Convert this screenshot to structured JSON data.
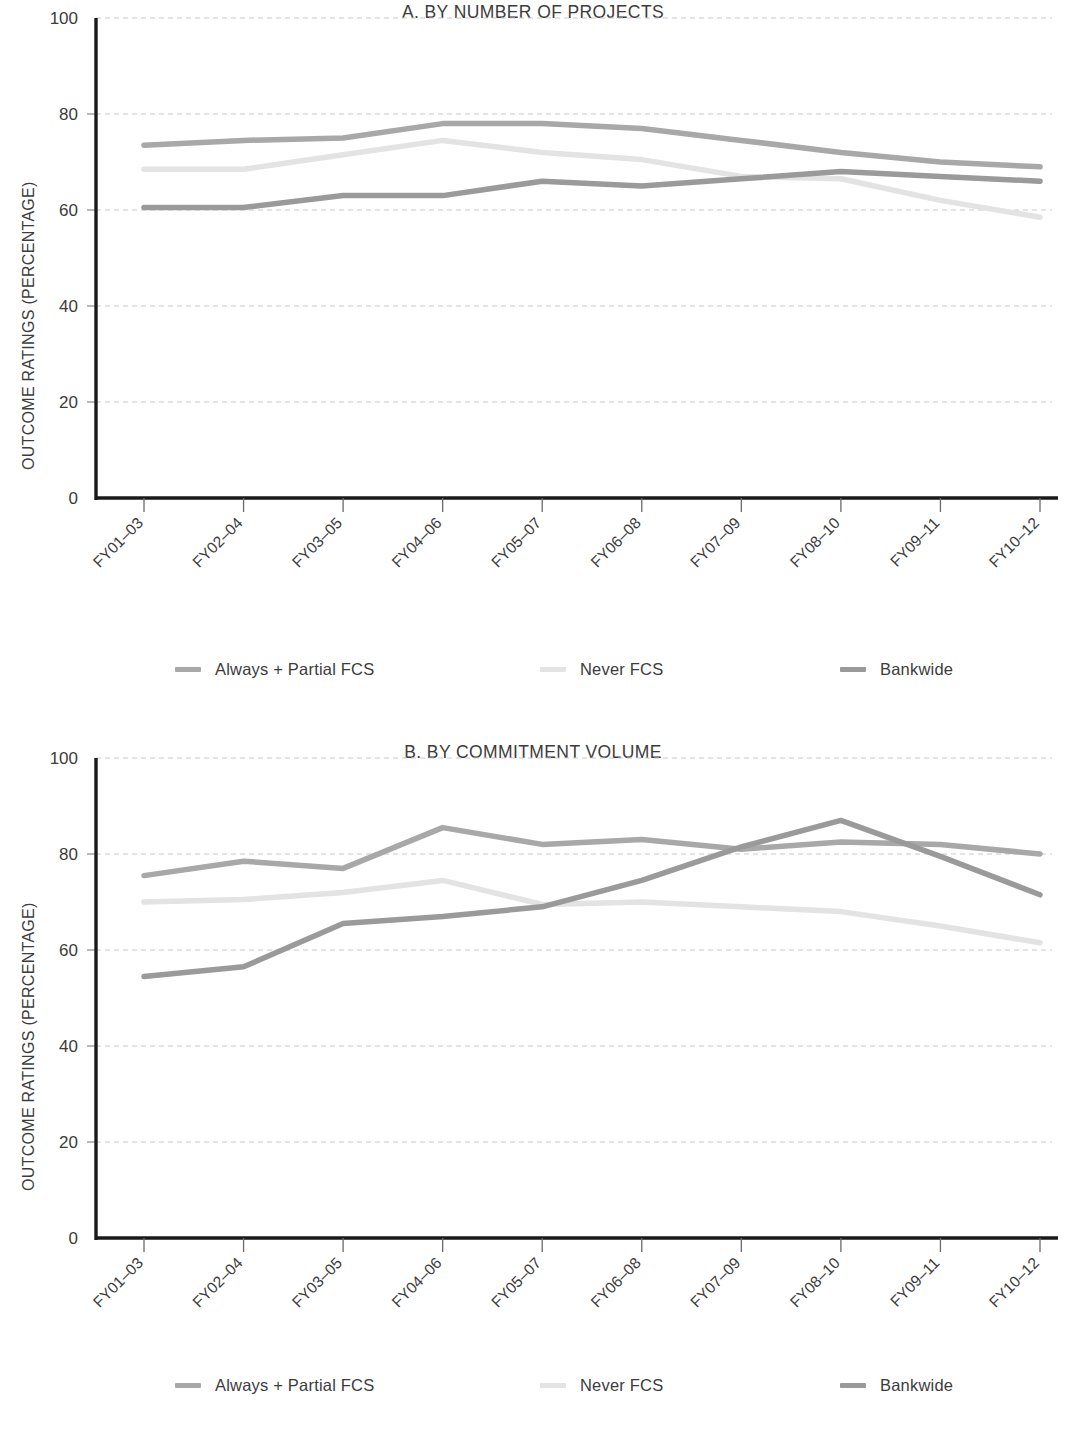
{
  "figure": {
    "ylabel": "OUTCOME RATINGS (PERCENTAGE)",
    "series_colors": {
      "always_partial_fcs": "#a8a8a8",
      "never_fcs": "#e3e3e3",
      "bankwide": "#9a9a9a"
    },
    "axis_color": "#1a1a1a",
    "grid_color": "#c9c9c9"
  },
  "panel_a": {
    "title": "A. BY NUMBER OF PROJECTS",
    "ylabel": "OUTCOME RATINGS (PERCENTAGE)",
    "legend": [
      {
        "label": "Always + Partial FCS",
        "color": "#a8a8a8"
      },
      {
        "label": "Never FCS",
        "color": "#e3e3e3"
      },
      {
        "label": "Bankwide",
        "color": "#9a9a9a"
      }
    ]
  },
  "panel_b": {
    "title": "B. BY COMMITMENT VOLUME",
    "ylabel": "OUTCOME RATINGS (PERCENTAGE)",
    "legend": [
      {
        "label": "Always + Partial FCS",
        "color": "#a8a8a8"
      },
      {
        "label": "Never FCS",
        "color": "#e3e3e3"
      },
      {
        "label": "Bankwide",
        "color": "#9a9a9a"
      }
    ]
  },
  "chart_data": [
    {
      "type": "line",
      "title": "A. BY NUMBER OF PROJECTS",
      "xlabel": "",
      "ylabel": "OUTCOME RATINGS (PERCENTAGE)",
      "ylim": [
        0,
        100
      ],
      "yticks": [
        0,
        20,
        40,
        60,
        80,
        100
      ],
      "grid": "horizontal-dashed",
      "legend_position": "below",
      "categories": [
        "FY01–03",
        "FY02–04",
        "FY03–05",
        "FY04–06",
        "FY05–07",
        "FY06–08",
        "FY07–09",
        "FY08–10",
        "FY09–11",
        "FY10–12"
      ],
      "series": [
        {
          "name": "Always + Partial FCS",
          "color": "#a8a8a8",
          "values": [
            73.5,
            74.5,
            75.0,
            78.0,
            78.0,
            77.0,
            74.5,
            72.0,
            70.0,
            69.0
          ]
        },
        {
          "name": "Never FCS",
          "color": "#e3e3e3",
          "values": [
            68.5,
            68.5,
            71.5,
            74.5,
            72.0,
            70.5,
            67.0,
            66.5,
            62.0,
            58.5
          ]
        },
        {
          "name": "Bankwide",
          "color": "#9a9a9a",
          "values": [
            60.5,
            60.5,
            63.0,
            63.0,
            66.0,
            65.0,
            66.5,
            68.0,
            67.0,
            66.0
          ]
        }
      ]
    },
    {
      "type": "line",
      "title": "B. BY COMMITMENT VOLUME",
      "xlabel": "",
      "ylabel": "OUTCOME RATINGS (PERCENTAGE)",
      "ylim": [
        0,
        100
      ],
      "yticks": [
        0,
        20,
        40,
        60,
        80,
        100
      ],
      "grid": "horizontal-dashed",
      "legend_position": "below",
      "categories": [
        "FY01–03",
        "FY02–04",
        "FY03–05",
        "FY04–06",
        "FY05–07",
        "FY06–08",
        "FY07–09",
        "FY08–10",
        "FY09–11",
        "FY10–12"
      ],
      "series": [
        {
          "name": "Always + Partial FCS",
          "color": "#a8a8a8",
          "values": [
            75.5,
            78.5,
            77.0,
            85.5,
            82.0,
            83.0,
            81.0,
            82.5,
            82.0,
            80.0
          ]
        },
        {
          "name": "Never FCS",
          "color": "#e3e3e3",
          "values": [
            70.0,
            70.5,
            72.0,
            74.5,
            69.5,
            70.0,
            69.0,
            68.0,
            65.0,
            61.5
          ]
        },
        {
          "name": "Bankwide",
          "color": "#9a9a9a",
          "values": [
            54.5,
            56.5,
            65.5,
            67.0,
            69.0,
            74.5,
            81.5,
            87.0,
            79.5,
            71.5
          ]
        }
      ]
    }
  ]
}
